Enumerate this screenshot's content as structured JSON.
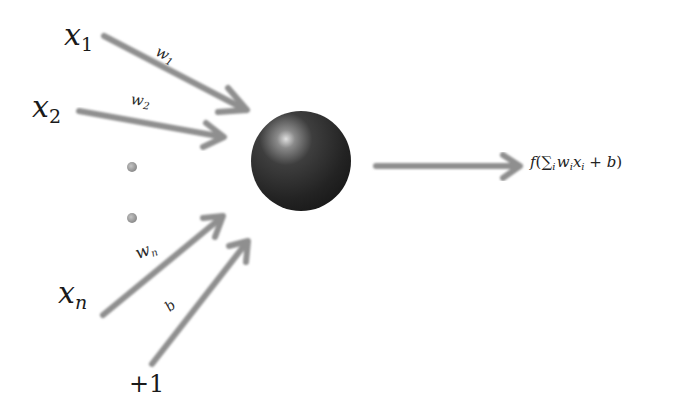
{
  "inputs": [
    {
      "id": "x1",
      "symbol": "x",
      "index": "1",
      "weight_symbol": "w",
      "weight_index": "1"
    },
    {
      "id": "x2",
      "symbol": "x",
      "index": "2",
      "weight_symbol": "w",
      "weight_index": "2"
    },
    {
      "id": "xn",
      "symbol": "x",
      "index": "n",
      "weight_symbol": "w",
      "weight_index": "n"
    }
  ],
  "bias": {
    "input_label": "+1",
    "weight_label": "b"
  },
  "ellipsis": "vertical-dots",
  "neuron": {
    "shape": "sphere",
    "color": "#2b2b2b",
    "highlight": "#d8d8d8"
  },
  "output": {
    "f": "f",
    "open": "(",
    "sum": "∑",
    "sum_index": "i",
    "w": "w",
    "w_index": "i",
    "x": "x",
    "x_index": "i",
    "plus": " + ",
    "b": "b",
    "close": ")"
  },
  "colors": {
    "arrow": "#8f8f8f",
    "text": "#1a1a1a",
    "dot": "#9a9a9a",
    "background": "#ffffff"
  }
}
